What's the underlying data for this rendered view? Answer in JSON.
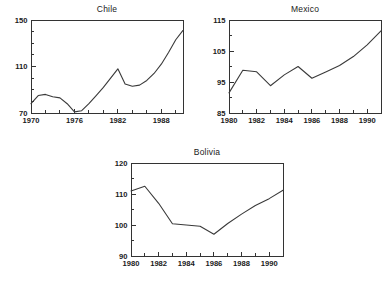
{
  "figure": {
    "background": "#ffffff",
    "line_color": "#3a3a3a",
    "axis_color": "#333333"
  },
  "panels": {
    "chile": {
      "title": "Chile"
    },
    "mexico": {
      "title": "Mexico"
    },
    "bolivia": {
      "title": "Bolivia"
    }
  },
  "chart_data": [
    {
      "type": "line",
      "title": "Chile",
      "xlabel": "",
      "ylabel": "",
      "xlim": [
        1970,
        1991
      ],
      "ylim": [
        70,
        150
      ],
      "grid": false,
      "legend": "none",
      "xticks": [
        1970,
        1972,
        1974,
        1976,
        1978,
        1980,
        1982,
        1984,
        1986,
        1988,
        1990
      ],
      "xtick_labels": [
        "1970",
        "",
        "",
        "1976",
        "",
        "",
        "1982",
        "",
        "",
        "1988",
        ""
      ],
      "yticks": [
        70,
        80,
        90,
        100,
        110,
        120,
        130,
        140,
        150
      ],
      "ytick_labels": [
        "70",
        "",
        "",
        "",
        "110",
        "",
        "",
        "",
        "150"
      ],
      "x": [
        1970,
        1971,
        1972,
        1973,
        1974,
        1975,
        1976,
        1977,
        1978,
        1979,
        1980,
        1981,
        1982,
        1983,
        1984,
        1985,
        1986,
        1987,
        1988,
        1989,
        1990,
        1991
      ],
      "values": [
        78,
        85,
        86,
        84,
        83,
        78,
        71,
        72,
        78,
        85,
        92,
        100,
        108,
        95,
        93,
        94,
        98,
        104,
        112,
        122,
        133,
        141
      ]
    },
    {
      "type": "line",
      "title": "Mexico",
      "xlabel": "",
      "ylabel": "",
      "xlim": [
        1980,
        1991
      ],
      "ylim": [
        85,
        115
      ],
      "grid": false,
      "legend": "none",
      "xticks": [
        1980,
        1981,
        1982,
        1983,
        1984,
        1985,
        1986,
        1987,
        1988,
        1989,
        1990,
        1991
      ],
      "xtick_labels": [
        "1980",
        "",
        "1982",
        "",
        "1984",
        "",
        "1986",
        "",
        "1988",
        "",
        "1990",
        ""
      ],
      "yticks": [
        85,
        90,
        95,
        100,
        105,
        110,
        115
      ],
      "ytick_labels": [
        "85",
        "",
        "95",
        "",
        "105",
        "",
        "115"
      ],
      "x": [
        1980,
        1981,
        1982,
        1983,
        1984,
        1985,
        1986,
        1987,
        1988,
        1989,
        1990,
        1991
      ],
      "values": [
        91.5,
        98.8,
        98.3,
        93.8,
        97.3,
        100.0,
        96.2,
        98.2,
        100.3,
        103.2,
        107.0,
        111.5
      ]
    },
    {
      "type": "line",
      "title": "Bolivia",
      "xlabel": "",
      "ylabel": "",
      "xlim": [
        1980,
        1991
      ],
      "ylim": [
        90,
        120
      ],
      "grid": false,
      "legend": "none",
      "xticks": [
        1980,
        1981,
        1982,
        1983,
        1984,
        1985,
        1986,
        1987,
        1988,
        1989,
        1990,
        1991
      ],
      "xtick_labels": [
        "1980",
        "",
        "1982",
        "",
        "1984",
        "",
        "1986",
        "",
        "1988",
        "",
        "1990",
        ""
      ],
      "yticks": [
        90,
        95,
        100,
        105,
        110,
        115,
        120
      ],
      "ytick_labels": [
        "90",
        "",
        "100",
        "",
        "110",
        "",
        "120"
      ],
      "x": [
        1980,
        1981,
        1982,
        1983,
        1984,
        1985,
        1986,
        1987,
        1988,
        1989,
        1990,
        1991
      ],
      "values": [
        111.0,
        112.5,
        107.0,
        100.4,
        100.0,
        99.6,
        97.0,
        100.5,
        103.5,
        106.3,
        108.5,
        111.2
      ]
    }
  ]
}
